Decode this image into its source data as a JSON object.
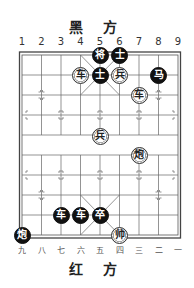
{
  "top_label": "黑 方",
  "bottom_label": "红 方",
  "top_files": [
    "1",
    "2",
    "3",
    "4",
    "5",
    "6",
    "7",
    "8",
    "9"
  ],
  "bottom_files": [
    "九",
    "八",
    "七",
    "六",
    "五",
    "四",
    "三",
    "二",
    "一"
  ],
  "board": {
    "files": 9,
    "ranks": 10,
    "line_color": "#555555",
    "border_color": "#444444"
  },
  "pieces": [
    {
      "side": "black",
      "char": "将",
      "file": 5,
      "rank": 0
    },
    {
      "side": "black",
      "char": "士",
      "file": 6,
      "rank": 0
    },
    {
      "side": "black",
      "char": "士",
      "file": 5,
      "rank": 1
    },
    {
      "side": "red",
      "char": "车",
      "file": 4,
      "rank": 1
    },
    {
      "side": "red",
      "char": "兵",
      "file": 6,
      "rank": 1
    },
    {
      "side": "black",
      "char": "马",
      "file": 8,
      "rank": 1
    },
    {
      "side": "red",
      "char": "车",
      "file": 7,
      "rank": 2
    },
    {
      "side": "red",
      "char": "兵",
      "file": 5,
      "rank": 4
    },
    {
      "side": "red",
      "char": "炮",
      "file": 7,
      "rank": 5
    },
    {
      "side": "black",
      "char": "车",
      "file": 3,
      "rank": 8
    },
    {
      "side": "black",
      "char": "车",
      "file": 4,
      "rank": 8
    },
    {
      "side": "black",
      "char": "卒",
      "file": 5,
      "rank": 8
    },
    {
      "side": "black",
      "char": "炮",
      "file": 1,
      "rank": 9
    },
    {
      "side": "red",
      "char": "帅",
      "file": 6,
      "rank": 9
    }
  ]
}
